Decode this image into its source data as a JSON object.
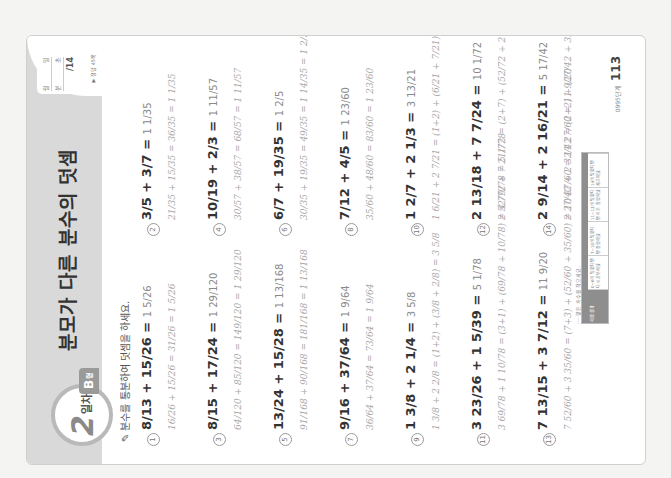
{
  "header": {
    "day_number": "2",
    "day_unit": "일차",
    "type_label": "B",
    "type_suffix": "형",
    "title": "분모가 다른 분수의 덧셈",
    "score_box": {
      "row1_a": "월",
      "row1_b": "일",
      "row2_a": "분",
      "row2_b": "초",
      "total": "/14"
    },
    "answer_ref": "▶ 정답 45쪽"
  },
  "instruction": "분수를 통분하여 덧셈을 하세요.",
  "problems": [
    {
      "no": "1",
      "expr": "8/13 + 15/26 =",
      "answer": "1 5/26",
      "work": "16/26 + 15/26 = 31/26 = 1 5/26"
    },
    {
      "no": "2",
      "expr": "3/5 + 3/7 =",
      "answer": "1 1/35",
      "work": "21/35 + 15/35 = 36/35 = 1 1/35"
    },
    {
      "no": "3",
      "expr": "8/15 + 17/24 =",
      "answer": "1 29/120",
      "work": "64/120 + 85/120 = 149/120 = 1 29/120"
    },
    {
      "no": "4",
      "expr": "10/19 + 2/3 =",
      "answer": "1 11/57",
      "work": "30/57 + 38/57 = 68/57 = 1 11/57"
    },
    {
      "no": "5",
      "expr": "13/24 + 15/28 =",
      "answer": "1 13/168",
      "work": "91/168 + 90/168 = 181/168 = 1 13/168"
    },
    {
      "no": "6",
      "expr": "6/7 + 19/35 =",
      "answer": "1 2/5",
      "work": "30/35 + 19/35 = 49/35 = 1 14/35 = 1 2/5"
    },
    {
      "no": "7",
      "expr": "9/16 + 37/64 =",
      "answer": "1 9/64",
      "work": "36/64 + 37/64 = 73/64 = 1 9/64"
    },
    {
      "no": "8",
      "expr": "7/12 + 4/5 =",
      "answer": "1 23/60",
      "work": "35/60 + 48/60 = 83/60 = 1 23/60"
    },
    {
      "no": "9",
      "expr": "1 3/8 + 2 1/4 =",
      "answer": "3 5/8",
      "work": "1 3/8 + 2 2/8 = (1+2) + (3/8 + 2/8) = 3 5/8"
    },
    {
      "no": "10",
      "expr": "1 2/7 + 2 1/3 =",
      "answer": "3 13/21",
      "work": "1 6/21 + 2 7/21 = (1+2) + (6/21 + 7/21) = 3 13/21"
    },
    {
      "no": "11",
      "expr": "3 23/26 + 1 5/39 =",
      "answer": "5 1/78",
      "work": "3 69/78 + 1 10/78 = (3+1) + (69/78 + 10/78) = 4 79/78 = 5 1/78"
    },
    {
      "no": "12",
      "expr": "2 13/18 + 7 7/24 =",
      "answer": "10 1/72",
      "work": "2 52/72 + 7 21/72 = (2+7) + (52/72 + 21/72) = 9 73/72 = 10 1/72"
    },
    {
      "no": "13",
      "expr": "7 13/15 + 3 7/12 =",
      "answer": "11 9/20",
      "work": "7 52/60 + 3 35/60 = (7+3) + (52/60 + 35/60) = 10 87/60 = 11 27/60 = 11 9/20"
    },
    {
      "no": "14",
      "expr": "2 9/14 + 2 16/21 =",
      "answer": "5 17/42",
      "work": "2 27/42 + 2 32/42 = (2+2) + (27/42 + 32/42) = 4 59/42 = 5 17/42"
    }
  ],
  "footer": {
    "note": "···· 맞은 개수를 적으세요.",
    "table_first": "채점 결과",
    "table_cells": [
      "0~6개 맞혔다면 다시 공부해요",
      "7~10개 맞혔다면 잘했어요",
      "11~13개 맞혔다면 아주 잘했어요",
      "14개 맞혔다면 최고예요"
    ],
    "book_code": "0995단계",
    "page_number": "113"
  }
}
